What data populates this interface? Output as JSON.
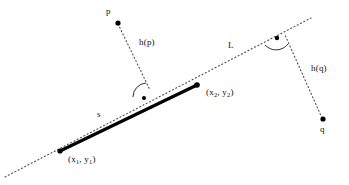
{
  "figure": {
    "type": "geometry-diagram",
    "colors": {
      "ink": "#111111",
      "segment": "#000000",
      "dotted": "#555555",
      "background": "#ffffff"
    },
    "labels": {
      "point_p": "p",
      "point_q": "q",
      "line_L": "L",
      "segment_s": "s",
      "height_p": "h(p)",
      "height_q": "h(q)",
      "endpoint_1_x": "(x",
      "endpoint_1_sub1": "1",
      "endpoint_1_mid": ", y",
      "endpoint_1_sub2": "1",
      "endpoint_1_end": ")",
      "endpoint_2_x": "(x",
      "endpoint_2_sub1": "2",
      "endpoint_2_mid": ", y",
      "endpoint_2_sub2": "2",
      "endpoint_2_end": ")"
    },
    "geometry": {
      "line_L": {
        "x1": 5,
        "y1": 177,
        "x2": 311,
        "y2": 18
      },
      "segment_s": {
        "x1": 60,
        "y1": 151,
        "x2": 197,
        "y2": 85
      },
      "point_p": {
        "x": 118,
        "y": 23
      },
      "point_q": {
        "x": 323,
        "y": 119
      },
      "foot_p": {
        "x": 147,
        "y": 93
      },
      "foot_q": {
        "x": 284,
        "y": 37
      },
      "angle_marker_p": {
        "x": 146,
        "y": 99
      },
      "angle_marker_q": {
        "x": 276,
        "y": 41
      },
      "endpoint_1": {
        "x": 60,
        "y": 151
      },
      "endpoint_2": {
        "x": 197,
        "y": 85
      }
    }
  }
}
